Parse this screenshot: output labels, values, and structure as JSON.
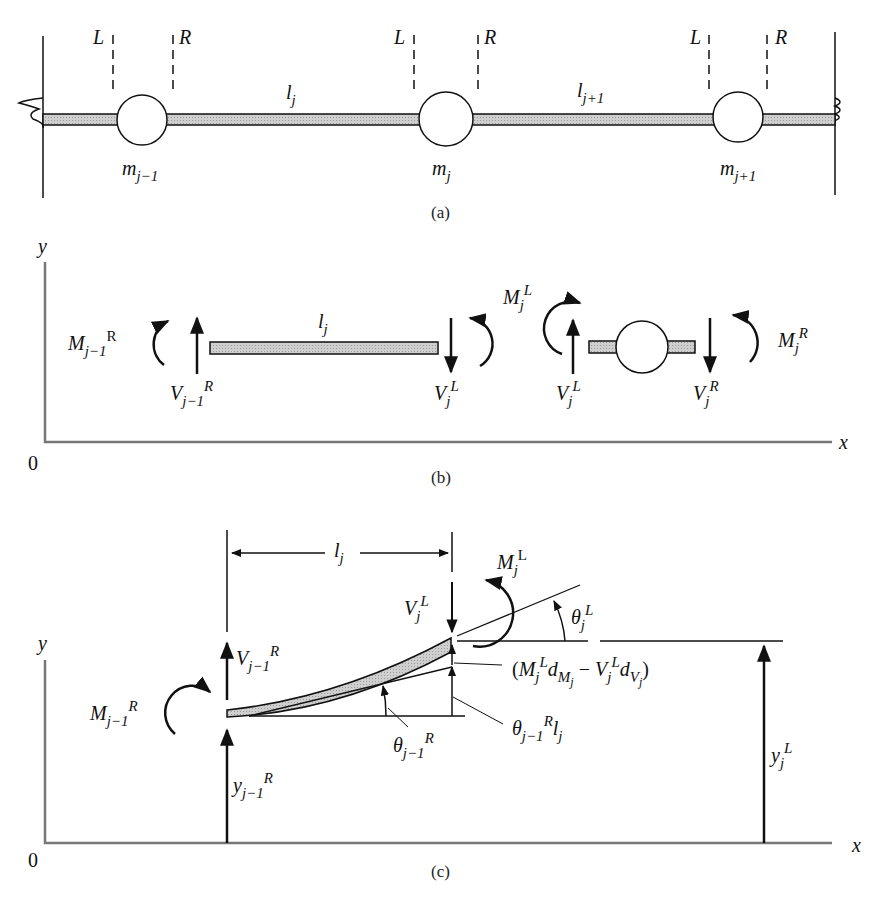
{
  "figure": {
    "panels": [
      {
        "id": "a",
        "caption": "(a)",
        "section_labels": [
          "L",
          "R",
          "L",
          "R",
          "L",
          "R"
        ],
        "masses": [
          {
            "base": "m",
            "sub": "j−1"
          },
          {
            "base": "m",
            "sub": "j"
          },
          {
            "base": "m",
            "sub": "j+1"
          }
        ],
        "spans": [
          {
            "base": "l",
            "sub": "j"
          },
          {
            "base": "l",
            "sub": "j+1"
          }
        ]
      },
      {
        "id": "b",
        "caption": "(b)",
        "axis": {
          "y": "y",
          "x": "x",
          "origin": "0"
        },
        "beam_label": {
          "base": "l",
          "sub": "j"
        },
        "forces": {
          "m_jm1_R": {
            "base": "M",
            "sub": "j−1",
            "sup": "R"
          },
          "v_jm1_R": {
            "base": "V",
            "sub": "j−1",
            "sup": "R"
          },
          "v_j_L_beam": {
            "base": "V",
            "sub": "j",
            "sup": "L"
          },
          "m_j_L": {
            "base": "M",
            "sub": "j",
            "sup": "L"
          },
          "v_j_L_mass": {
            "base": "V",
            "sub": "j",
            "sup": "L"
          },
          "v_j_R": {
            "base": "V",
            "sub": "j",
            "sup": "R"
          },
          "m_j_R": {
            "base": "M",
            "sub": "j",
            "sup": "R"
          }
        }
      },
      {
        "id": "c",
        "caption": "(c)",
        "axis": {
          "y": "y",
          "x": "x",
          "origin": "0"
        },
        "span": {
          "base": "l",
          "sub": "j"
        },
        "labels": {
          "v_j_L": {
            "base": "V",
            "sub": "j",
            "sup": "L"
          },
          "m_j_L": {
            "base": "M",
            "sub": "j",
            "sup": "L"
          },
          "theta_j_L": {
            "base": "θ",
            "sub": "j",
            "sup": "L"
          },
          "v_jm1_R": {
            "base": "V",
            "sub": "j−1",
            "sup": "R"
          },
          "m_jm1_R": {
            "base": "M",
            "sub": "j−1",
            "sup": "R"
          },
          "theta_jm1_R": {
            "base": "θ",
            "sub": "j−1",
            "sup": "R"
          },
          "y_jm1_R": {
            "base": "y",
            "sub": "j−1",
            "sup": "R"
          },
          "y_j_L": {
            "base": "y",
            "sub": "j",
            "sup": "L"
          },
          "deflection_term": {
            "open": "(",
            "m": "M",
            "m_sub": "j",
            "m_sup": "L",
            "d1": "d",
            "d1_sub": "M",
            "d1_subsub": "j",
            "minus": " − ",
            "v": "V",
            "v_sub": "j",
            "v_sup": "L",
            "d2": "d",
            "d2_sub": "V",
            "d2_subsub": "j",
            "close": ")"
          },
          "rotation_term": {
            "base": "θ",
            "sub": "j−1",
            "sup": "R",
            "l": "l",
            "l_sub": "j"
          }
        }
      }
    ]
  },
  "colors": {
    "ink": "#111111",
    "beam_fill": "#c8c8c8",
    "axis": "#777777"
  }
}
